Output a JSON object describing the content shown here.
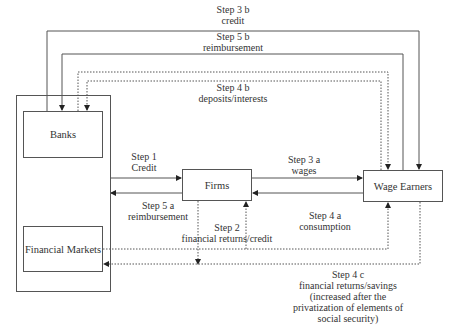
{
  "diagram": {
    "type": "flow",
    "nodes": {
      "outer_container": {
        "label": ""
      },
      "banks": {
        "label": "Banks"
      },
      "financial_markets": {
        "label": "Financial Markets"
      },
      "firms": {
        "label": "Firms"
      },
      "wage_earners": {
        "label": "Wage Earners"
      }
    },
    "edges": {
      "step3b": {
        "step": "Step 3 b",
        "text": "credit",
        "from": "banks",
        "to": "wage_earners",
        "style": "solid"
      },
      "step5b": {
        "step": "Step 5 b",
        "text": "reimbursement",
        "from": "wage_earners",
        "to": "banks",
        "style": "solid"
      },
      "step4b": {
        "step": "Step 4 b",
        "text": "deposits/interests",
        "style": "dotted",
        "between": [
          "banks",
          "wage_earners"
        ]
      },
      "step1": {
        "step": "Step 1",
        "text": "Credit",
        "from": "banks",
        "to": "firms",
        "style": "solid"
      },
      "step5a": {
        "step": "Step 5 a",
        "text": "reimbursement",
        "from": "firms",
        "to": "banks",
        "style": "solid"
      },
      "step3a": {
        "step": "Step 3 a",
        "text": "wages",
        "from": "firms",
        "to": "wage_earners",
        "style": "solid"
      },
      "step4a": {
        "step": "Step 4 a",
        "text": "consumption",
        "from": "wage_earners",
        "to": "firms",
        "style": "solid"
      },
      "step2": {
        "step": "Step 2",
        "text": "financial returns/credit",
        "style": "dotted",
        "between": [
          "firms",
          "financial_markets"
        ]
      },
      "step4c": {
        "step": "Step 4 c",
        "lines": [
          "financial returns/savings",
          "(increased after the",
          "privatization of elements of",
          "social security)"
        ],
        "style": "dotted",
        "between": [
          "wage_earners",
          "financial_markets"
        ]
      }
    },
    "colors": {
      "line": "#555555",
      "text": "#333333",
      "background": "#ffffff"
    }
  }
}
